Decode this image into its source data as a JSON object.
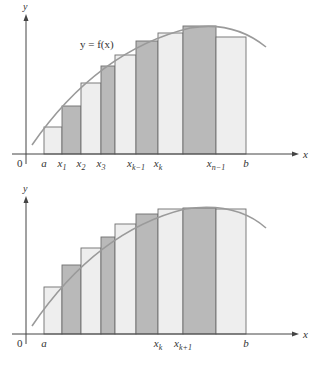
{
  "colors": {
    "light_bar": "#eeeeee",
    "dark_bar": "#b9b9b9",
    "bar_edge": "#6f6f6f",
    "curve": "#9a9a9a",
    "axis": "#444444",
    "text": "#333333"
  },
  "panels": [
    {
      "name": "upper-sum-panel",
      "axis_y": 154,
      "axis_x": 26,
      "y_top": 14,
      "x_right": 299,
      "y_label": "y",
      "x_label": "x",
      "origin_label": "0",
      "curve_label": "y = f(x)",
      "curve_label_pos": [
        80,
        48
      ],
      "curve": "M32,145 C70,90 120,45 190,28 C225,22 250,34 266,47",
      "boundaries": [
        44,
        62,
        81,
        101,
        115,
        136,
        158,
        183,
        216,
        246
      ],
      "bar_tops": [
        127,
        106,
        83,
        66,
        55,
        41,
        33,
        26,
        37
      ],
      "bar_shades": [
        "light",
        "dark",
        "light",
        "dark",
        "light",
        "dark",
        "light",
        "dark",
        "light"
      ],
      "tick_labels": [
        {
          "x": 44,
          "main": "a",
          "sub": ""
        },
        {
          "x": 62,
          "main": "x",
          "sub": "1"
        },
        {
          "x": 81,
          "main": "x",
          "sub": "2"
        },
        {
          "x": 101,
          "main": "x",
          "sub": "3"
        },
        {
          "x": 136,
          "main": "x",
          "sub": "k−1"
        },
        {
          "x": 158,
          "main": "x",
          "sub": "k"
        },
        {
          "x": 216,
          "main": "x",
          "sub": "n−1"
        },
        {
          "x": 246,
          "main": "b",
          "sub": ""
        }
      ]
    },
    {
      "name": "lower-sum-panel",
      "axis_y": 334,
      "axis_x": 26,
      "y_top": 196,
      "x_right": 299,
      "y_label": "y",
      "x_label": "x",
      "origin_label": "0",
      "curve_label": "",
      "curve_label_pos": [
        0,
        0
      ],
      "curve": "M32,326 C70,270 120,225 185,209 C225,203 250,214 266,228",
      "boundaries": [
        44,
        62,
        81,
        101,
        115,
        136,
        158,
        183,
        216,
        246
      ],
      "bar_tops": [
        287,
        265,
        248,
        237,
        224,
        214,
        209,
        208,
        209
      ],
      "bar_shades": [
        "light",
        "dark",
        "light",
        "dark",
        "light",
        "dark",
        "light",
        "dark",
        "light"
      ],
      "tick_labels": [
        {
          "x": 44,
          "main": "a",
          "sub": ""
        },
        {
          "x": 158,
          "main": "x",
          "sub": "k"
        },
        {
          "x": 183,
          "main": "x",
          "sub": "k+1"
        },
        {
          "x": 246,
          "main": "b",
          "sub": ""
        }
      ]
    }
  ]
}
